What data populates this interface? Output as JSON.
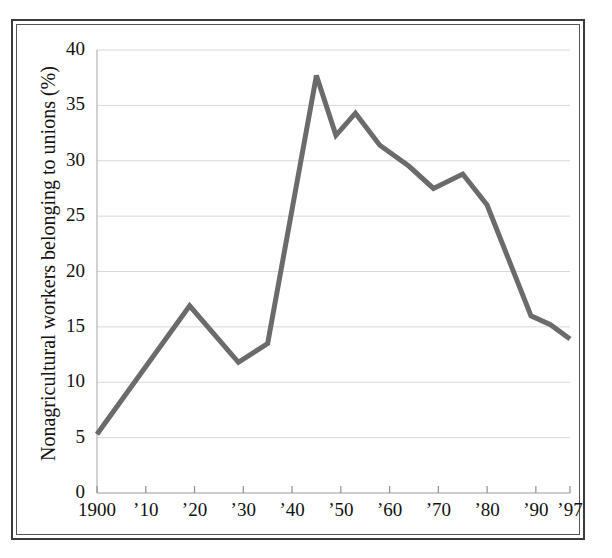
{
  "figure": {
    "kind": "line-chart",
    "background_color": "#ffffff",
    "frame_color": "#3b3b3b",
    "inner_frame_color": "#555555"
  },
  "chart_data": {
    "type": "line",
    "title": "",
    "subtitle": "",
    "xlabel": "",
    "ylabel": "Nonagricultural workers belonging to unions (%)",
    "xlim": [
      1900,
      1997
    ],
    "ylim": [
      0,
      40
    ],
    "grid": true,
    "grid_color": "#d8d8d8",
    "legend": null,
    "legend_position": "none",
    "line_color": "#6b6b6b",
    "line_width": 5,
    "y_ticks": [
      0,
      5,
      10,
      15,
      20,
      25,
      30,
      35,
      40
    ],
    "y_tick_labels": [
      "0",
      "5",
      "10",
      "15",
      "20",
      "25",
      "30",
      "35",
      "40"
    ],
    "x_ticks": [
      1900,
      1910,
      1920,
      1930,
      1940,
      1950,
      1960,
      1970,
      1980,
      1990,
      1997
    ],
    "x_tick_labels": [
      "1900",
      "’10",
      "’20",
      "’30",
      "’40",
      "’50",
      "’60",
      "’70",
      "’80",
      "’90",
      "’97"
    ],
    "series": [
      {
        "name": "Union membership share",
        "x": [
          1900,
          1919,
          1929,
          1935,
          1945,
          1949,
          1953,
          1958,
          1964,
          1969,
          1975,
          1980,
          1989,
          1993,
          1997
        ],
        "values": [
          5.3,
          16.9,
          11.8,
          13.5,
          37.7,
          32.3,
          34.3,
          31.4,
          29.5,
          27.5,
          28.8,
          26.0,
          16.0,
          15.2,
          13.9
        ]
      }
    ],
    "annotations": []
  }
}
